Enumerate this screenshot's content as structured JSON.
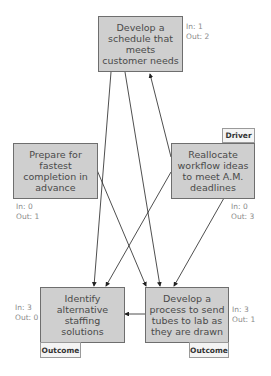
{
  "nodes": {
    "top": {
      "label": "Develop a schedule that meets customer needs",
      "in": "In: 1",
      "out": "Out: 2"
    },
    "left": {
      "label": "Prepare for fastest completion in advance",
      "in": "In: 0",
      "out": "Out: 1"
    },
    "driver": {
      "label": "Reallocate workflow ideas to meet A.M. deadlines",
      "in": "In: 0",
      "out": "Out: 3",
      "tag": "Driver"
    },
    "bottom_left": {
      "label": "Identify alternative staffing solutions",
      "in": "In: 3",
      "out": "Out: 0",
      "tag": "Outcome"
    },
    "bottom_right": {
      "label": "Develop a process to send tubes to lab as they are drawn",
      "in": "In: 3",
      "out": "Out: 1",
      "tag": "Outcome"
    }
  },
  "colors": {
    "node_fill": "#cfcfcf",
    "node_border": "#6e6e6e",
    "arrow": "#222222"
  }
}
